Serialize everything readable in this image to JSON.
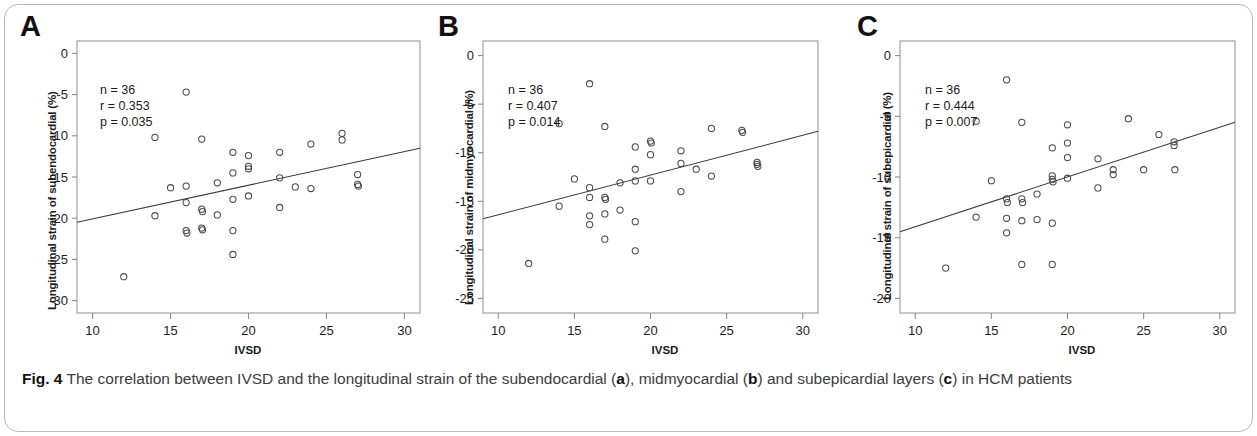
{
  "figure": {
    "caption_prefix": "Fig. 4",
    "caption_part1": " The correlation between IVSD and the longitudinal strain of the subendocardial (",
    "caption_a": "a",
    "caption_part2": "), midmyocardial (",
    "caption_b": "b",
    "caption_part3": ") and subepicardial layers (",
    "caption_c": "c",
    "caption_part4": ") in HCM patients"
  },
  "chart_data": [
    {
      "type": "scatter",
      "panel": "A",
      "panel_letter": "A",
      "title": "",
      "xlabel": "IVSD",
      "ylabel": "Longitudinal strain of subendocardial (%)",
      "xlim": [
        9,
        31
      ],
      "ylim": [
        -31.5,
        1.5
      ],
      "xticks": [
        10,
        15,
        20,
        25,
        30
      ],
      "yticks": [
        0,
        -5,
        -10,
        -15,
        -20,
        -25,
        -30
      ],
      "xtick_labels": [
        "10",
        "15",
        "20",
        "25",
        "30"
      ],
      "ytick_labels": [
        "0",
        "-5",
        "-10",
        "-15",
        "-20",
        "-25",
        "-30"
      ],
      "grid": false,
      "legend": "none",
      "n": 36,
      "r": 0.353,
      "p": 0.035,
      "stats_n": "n = 36",
      "stats_r": "r = 0.353",
      "stats_p": "p = 0.035",
      "fit_line": {
        "x1": 9,
        "y1": -20.5,
        "x2": 31,
        "y2": -11.5
      },
      "points": [
        [
          12.0,
          -27.1
        ],
        [
          14.0,
          -10.2
        ],
        [
          14.0,
          -19.7
        ],
        [
          15.0,
          -16.3
        ],
        [
          16.0,
          -4.7
        ],
        [
          16.0,
          -16.1
        ],
        [
          16.0,
          -18.1
        ],
        [
          16.0,
          -21.5
        ],
        [
          16.05,
          -21.8
        ],
        [
          17.0,
          -18.9
        ],
        [
          17.05,
          -19.2
        ],
        [
          17.0,
          -21.2
        ],
        [
          17.05,
          -21.4
        ],
        [
          17.0,
          -10.4
        ],
        [
          18.0,
          -15.7
        ],
        [
          18.0,
          -19.6
        ],
        [
          19.0,
          -12.0
        ],
        [
          19.0,
          -14.5
        ],
        [
          19.0,
          -17.7
        ],
        [
          19.0,
          -21.5
        ],
        [
          19.0,
          -24.4
        ],
        [
          20.0,
          -12.4
        ],
        [
          20.0,
          -13.7
        ],
        [
          20.0,
          -14.0
        ],
        [
          20.0,
          -17.3
        ],
        [
          22.0,
          -12.0
        ],
        [
          22.0,
          -15.1
        ],
        [
          22.0,
          -18.7
        ],
        [
          23.0,
          -16.2
        ],
        [
          24.0,
          -11.0
        ],
        [
          24.0,
          -16.4
        ],
        [
          26.0,
          -9.7
        ],
        [
          26.0,
          -10.5
        ],
        [
          27.0,
          -14.7
        ],
        [
          27.0,
          -15.9
        ],
        [
          27.05,
          -16.1
        ]
      ]
    },
    {
      "type": "scatter",
      "panel": "B",
      "panel_letter": "B",
      "title": "",
      "xlabel": "IVSD",
      "ylabel": "Longitudinal strain of midmyocardial (%)",
      "xlim": [
        9,
        31
      ],
      "ylim": [
        -26.5,
        1.5
      ],
      "xticks": [
        10,
        15,
        20,
        25,
        30
      ],
      "yticks": [
        0,
        -5,
        -10,
        -15,
        -20,
        -25
      ],
      "xtick_labels": [
        "10",
        "15",
        "20",
        "25",
        "30"
      ],
      "ytick_labels": [
        "0",
        "-5",
        "-10",
        "-15",
        "-20",
        "-25"
      ],
      "grid": false,
      "legend": "none",
      "n": 36,
      "r": 0.407,
      "p": 0.014,
      "stats_n": "n = 36",
      "stats_r": "r = 0.407",
      "stats_p": "p = 0.014",
      "fit_line": {
        "x1": 9,
        "y1": -16.8,
        "x2": 31,
        "y2": -7.8
      },
      "points": [
        [
          12.0,
          -21.4
        ],
        [
          14.0,
          -7.0
        ],
        [
          14.0,
          -15.5
        ],
        [
          15.0,
          -12.7
        ],
        [
          16.0,
          -2.9
        ],
        [
          16.0,
          -13.6
        ],
        [
          16.0,
          -14.6
        ],
        [
          16.0,
          -16.5
        ],
        [
          16.0,
          -17.4
        ],
        [
          17.0,
          -7.3
        ],
        [
          17.0,
          -14.6
        ],
        [
          17.05,
          -14.8
        ],
        [
          17.0,
          -16.3
        ],
        [
          17.0,
          -18.9
        ],
        [
          18.0,
          -13.1
        ],
        [
          18.0,
          -15.9
        ],
        [
          19.0,
          -9.4
        ],
        [
          19.0,
          -11.7
        ],
        [
          19.0,
          -12.9
        ],
        [
          19.0,
          -17.1
        ],
        [
          19.0,
          -20.1
        ],
        [
          20.0,
          -8.8
        ],
        [
          20.05,
          -9.0
        ],
        [
          20.0,
          -10.2
        ],
        [
          20.0,
          -12.9
        ],
        [
          22.0,
          -9.8
        ],
        [
          22.0,
          -11.1
        ],
        [
          22.0,
          -14.0
        ],
        [
          23.0,
          -11.7
        ],
        [
          24.0,
          -7.5
        ],
        [
          24.0,
          -12.4
        ],
        [
          26.0,
          -7.7
        ],
        [
          26.05,
          -7.9
        ],
        [
          27.0,
          -11.0
        ],
        [
          27.0,
          -11.2
        ],
        [
          27.05,
          -11.4
        ]
      ]
    },
    {
      "type": "scatter",
      "panel": "C",
      "panel_letter": "C",
      "title": "",
      "xlabel": "IVSD",
      "ylabel": "Longitudinal strain of subepicardial (%)",
      "xlim": [
        9,
        31
      ],
      "ylim": [
        -21.2,
        1.2
      ],
      "xticks": [
        10,
        15,
        20,
        25,
        30
      ],
      "yticks": [
        0,
        -5,
        -10,
        -15,
        -20
      ],
      "xtick_labels": [
        "10",
        "15",
        "20",
        "25",
        "30"
      ],
      "ytick_labels": [
        "0",
        "-5",
        "-10",
        "-15",
        "-20"
      ],
      "grid": false,
      "legend": "none",
      "n": 36,
      "r": 0.444,
      "p": 0.007,
      "stats_n": "n = 36",
      "stats_r": "r = 0.444",
      "stats_p": "p = 0.007",
      "fit_line": {
        "x1": 9,
        "y1": -14.5,
        "x2": 31,
        "y2": -5.5
      },
      "points": [
        [
          12.0,
          -17.5
        ],
        [
          14.0,
          -5.4
        ],
        [
          14.0,
          -13.3
        ],
        [
          15.0,
          -10.3
        ],
        [
          16.0,
          -2.0
        ],
        [
          16.0,
          -11.8
        ],
        [
          16.05,
          -12.1
        ],
        [
          16.0,
          -13.4
        ],
        [
          16.0,
          -14.6
        ],
        [
          17.0,
          -5.5
        ],
        [
          17.0,
          -11.8
        ],
        [
          17.05,
          -12.1
        ],
        [
          17.0,
          -13.6
        ],
        [
          17.0,
          -17.2
        ],
        [
          18.0,
          -11.4
        ],
        [
          18.0,
          -13.5
        ],
        [
          19.0,
          -7.6
        ],
        [
          19.0,
          -9.9
        ],
        [
          19.0,
          -10.2
        ],
        [
          19.05,
          -10.4
        ],
        [
          19.0,
          -13.8
        ],
        [
          19.0,
          -17.2
        ],
        [
          20.0,
          -5.7
        ],
        [
          20.0,
          -7.2
        ],
        [
          20.0,
          -8.4
        ],
        [
          20.0,
          -10.1
        ],
        [
          22.0,
          -8.5
        ],
        [
          22.0,
          -10.9
        ],
        [
          23.0,
          -9.4
        ],
        [
          23.0,
          -9.8
        ],
        [
          24.0,
          -5.2
        ],
        [
          26.0,
          -6.5
        ],
        [
          27.0,
          -7.1
        ],
        [
          27.0,
          -7.4
        ],
        [
          27.05,
          -9.4
        ],
        [
          25.0,
          -9.4
        ]
      ]
    }
  ]
}
